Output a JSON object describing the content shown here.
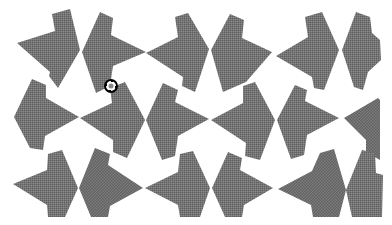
{
  "canvas": {
    "width": 392,
    "height": 225,
    "background": "#ffffff",
    "tile_color": "#6e6e6e",
    "tile_color_alt": "#7a7a7a"
  },
  "tiles": [
    {
      "id": "A",
      "points": "52,14 70,9 80,50 58,88 49,76 50,72 17,43 55,31",
      "alt": false
    },
    {
      "id": "B",
      "points": "100,12 113,18 111,35 146,52 113,66 110,86 96,93 82,52",
      "alt": false
    },
    {
      "id": "C",
      "points": "175,17 188,13 209,49 195,92 182,86 183,77 146,53 178,37",
      "alt": false
    },
    {
      "id": "D",
      "points": "230,14 244,20 242,38 272,52 246,82 223,92 211,50",
      "alt": false
    },
    {
      "id": "E",
      "points": "305,17 322,12 339,50 324,90 314,88 312,77 276,56 308,37",
      "alt": false
    },
    {
      "id": "F",
      "points": "356,12 370,17 372,33 380,40 381,60 368,72 363,90 354,87 342,50",
      "alt": false
    },
    {
      "id": "G",
      "points": "32,79 46,85 46,98 79,117 45,136 43,150 30,148 14,117",
      "alt": false
    },
    {
      "id": "H",
      "points": "110,88 125,82 145,120 127,158 113,152 113,140 80,118 112,103",
      "alt": false
    },
    {
      "id": "I",
      "points": "163,83 178,90 175,102 209,119 178,136 175,156 162,160 146,120",
      "alt": false
    },
    {
      "id": "J",
      "points": "243,86 255,82 275,120 260,160 245,156 246,143 211,120 243,103",
      "alt": false
    },
    {
      "id": "K",
      "points": "295,85 307,90 305,101 339,118 307,135 304,155 291,159 277,120",
      "alt": false
    },
    {
      "id": "L",
      "points": "344,118 378,98 380,100 380,160 366,152 366,140",
      "alt": true
    },
    {
      "id": "M",
      "points": "48,154 62,150 78,188 65,217 48,217 47,205 13,184 47,170",
      "alt": false
    },
    {
      "id": "N",
      "points": "95,148 110,154 108,165 143,188 110,206 108,217 91,217 79,188",
      "alt": true
    },
    {
      "id": "O",
      "points": "180,154 193,151 210,188 200,217 180,217 178,205 145,188 178,172",
      "alt": false
    },
    {
      "id": "P",
      "points": "228,152 242,158 240,170 273,188 244,205 242,217 225,217 212,188",
      "alt": false
    },
    {
      "id": "Q",
      "points": "320,153 334,149 346,190 339,217 313,217 311,205 278,189 312,171",
      "alt": true
    },
    {
      "id": "R",
      "points": "362,150 375,153 376,173 383,175 382,217 352,217 346,190",
      "alt": false
    }
  ],
  "cursor": {
    "icon": "rotate-move-cursor-icon",
    "x": 103,
    "y": 78
  }
}
